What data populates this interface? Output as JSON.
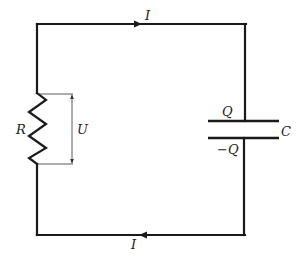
{
  "diagram": {
    "type": "RC circuit",
    "labels": {
      "current_top": "I",
      "current_bottom": "I",
      "resistor": "R",
      "voltage": "U",
      "capacitor": "C",
      "charge_positive": "Q",
      "charge_negative": "−Q"
    },
    "components": [
      {
        "id": "resistor",
        "label": "R",
        "position": "left branch"
      },
      {
        "id": "capacitor",
        "label": "C",
        "position": "right branch",
        "plate_charges": [
          "Q",
          "−Q"
        ]
      },
      {
        "id": "voltage-indicator",
        "label": "U",
        "across": "resistor"
      }
    ],
    "current_direction": {
      "top_wire": "left-to-right",
      "bottom_wire": "right-to-left"
    },
    "colors": {
      "line": "#1a1a1a",
      "background": "#ffffff"
    }
  }
}
